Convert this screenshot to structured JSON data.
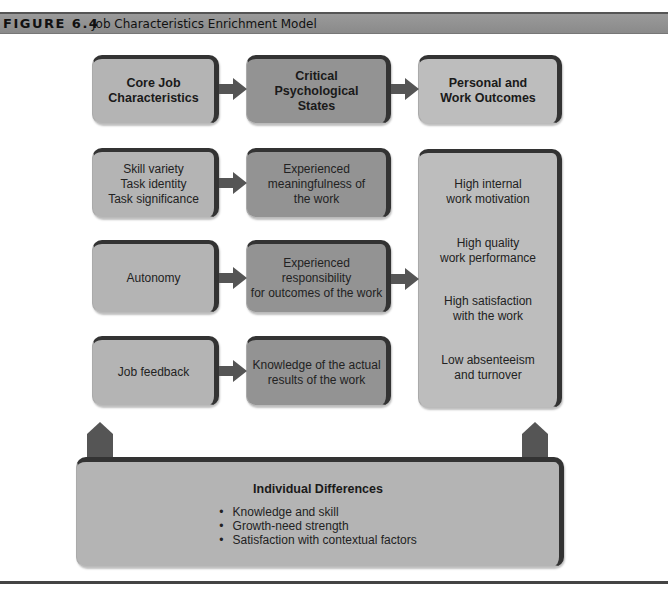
{
  "header": {
    "figure_label": "FIGURE 6.4",
    "caption": "Job Characteristics Enrichment Model"
  },
  "columns": {
    "core": {
      "title_line1": "Core Job",
      "title_line2": "Characteristics"
    },
    "states": {
      "title_line1": "Critical",
      "title_line2": "Psychological",
      "title_line3": "States"
    },
    "outcomes": {
      "title_line1": "Personal and",
      "title_line2": "Work Outcomes"
    }
  },
  "core_items": [
    {
      "lines": [
        "Skill variety",
        "Task identity",
        "Task significance"
      ]
    },
    {
      "lines": [
        "Autonomy"
      ]
    },
    {
      "lines": [
        "Job feedback"
      ]
    }
  ],
  "state_items": [
    {
      "lines": [
        "Experienced",
        "meaningfulness of",
        "the work"
      ]
    },
    {
      "lines": [
        "Experienced responsibility",
        "for outcomes of the work"
      ]
    },
    {
      "lines": [
        "Knowledge of the actual",
        "results of the work"
      ]
    }
  ],
  "outcome_items": [
    {
      "lines": [
        "High internal",
        "work motivation"
      ]
    },
    {
      "lines": [
        "High quality",
        "work performance"
      ]
    },
    {
      "lines": [
        "High satisfaction",
        "with the work"
      ]
    },
    {
      "lines": [
        "Low absenteeism",
        "and turnover"
      ]
    }
  ],
  "individual_differences": {
    "title": "Individual Differences",
    "items": [
      "Knowledge and skill",
      "Growth-need strength",
      "Satisfaction with contextual factors"
    ]
  },
  "colors": {
    "core_fill": "#b4b4b4",
    "state_fill": "#939393",
    "outcome_fill": "#bdbdbd",
    "arrow": "#555555",
    "border": "#333333"
  }
}
